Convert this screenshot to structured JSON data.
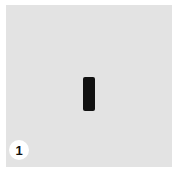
{
  "figure": {
    "background_color": "#e3e3e3",
    "shape": {
      "type": "vertical-rounded-rectangle",
      "color": "#111111"
    },
    "step_badge": {
      "label": "1"
    }
  }
}
